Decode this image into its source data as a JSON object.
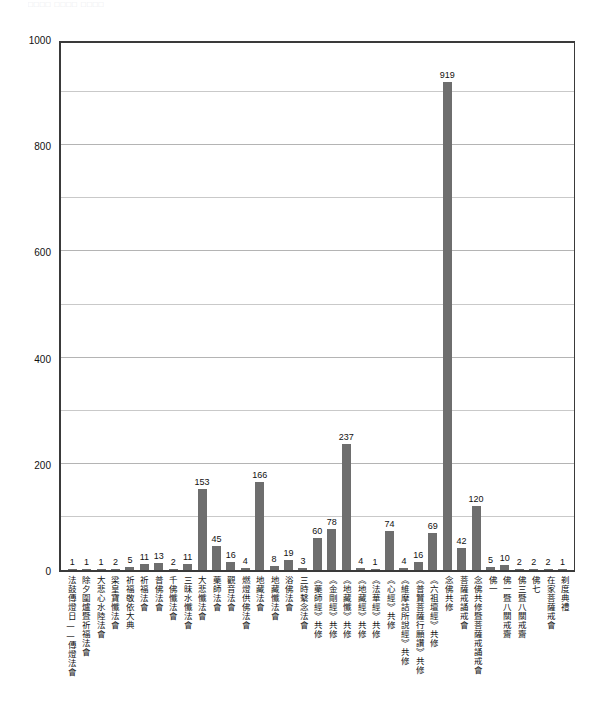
{
  "page": {
    "top_sliver_text": "□□□□ □□□□  □□□□",
    "background_color": "#ffffff"
  },
  "style": {
    "bar_color": "#6e6e6e",
    "axis_color": "#3a3a3a",
    "grid_color": "#c9c9c9",
    "text_color": "#111111"
  },
  "chart_data": {
    "type": "bar",
    "title": "",
    "subtitle": "",
    "xlabel": "",
    "ylabel": "",
    "ylim": [
      0,
      1000
    ],
    "ytick_labels": [
      "1000",
      "800",
      "600",
      "400",
      "200",
      "0"
    ],
    "ytick_values": [
      1000,
      800,
      600,
      400,
      200,
      0
    ],
    "grid": true,
    "grid_minor_step": 100,
    "grid_major_step": 200,
    "legend": "none",
    "legend_position": "none",
    "orientation": "vertical",
    "categories": [
      "法鼓傳燈日——傳燈法會",
      "除夕圍爐暨祈福法會",
      "大悲心水陸法會",
      "梁皇寶懺法會",
      "祈福敬依大典",
      "祈福法會",
      "普佛法會",
      "千佛懺法會",
      "三昧水懺法會",
      "大悲懺法會",
      "藥師法會",
      "觀音法會",
      "燃燈供佛法會",
      "地藏法會",
      "地藏懺法會",
      "浴佛法會",
      "三時繫念法會",
      "《藥師經》共修",
      "《金剛經》共修",
      "《地藏懺》共修",
      "《地藏經》共修",
      "《法華經》共修",
      "《心經》共修",
      "《維摩詰所說經》共修",
      "《普賢菩薩行願讚》共修",
      "《六祖壇經》共修",
      "念佛共修",
      "菩薩戒誦戒會",
      "念佛共修暨菩薩戒誦戒會",
      "佛一",
      "佛一暨八關戒齋",
      "佛三暨八關戒齋",
      "佛七",
      "在家菩薩戒會",
      "剃度典禮"
    ],
    "values": [
      1,
      1,
      1,
      2,
      5,
      11,
      13,
      2,
      11,
      153,
      45,
      16,
      4,
      166,
      8,
      19,
      3,
      60,
      78,
      237,
      4,
      1,
      74,
      4,
      16,
      69,
      919,
      42,
      120,
      5,
      10,
      2,
      2,
      2,
      1
    ]
  }
}
